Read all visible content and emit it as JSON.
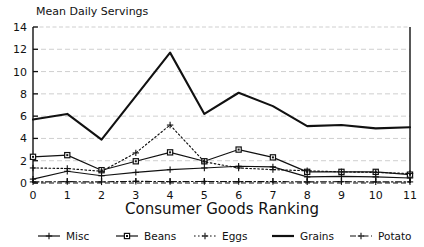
{
  "chart_data": {
    "type": "line",
    "title": "Mean Daily Servings",
    "xlabel": "Consumer Goods Ranking",
    "ylabel": "",
    "x": [
      0,
      1,
      2,
      3,
      4,
      5,
      6,
      7,
      8,
      9,
      10,
      11
    ],
    "xticklabels": [
      "0",
      "1",
      "2",
      "3",
      "4",
      "5",
      "6",
      "7",
      "8",
      "9",
      "10",
      "11"
    ],
    "yticklabels": [
      "0",
      "2",
      "4",
      "6",
      "8",
      "10",
      "12",
      "14"
    ],
    "yticks": [
      0,
      2,
      4,
      6,
      8,
      10,
      12,
      14
    ],
    "xlim": [
      0,
      11
    ],
    "ylim": [
      0,
      14
    ],
    "grid": true,
    "legend_position": "below",
    "series": [
      {
        "name": "Misc",
        "marker": "plus",
        "dash": "solid",
        "values": [
          0.35,
          1.05,
          0.65,
          0.95,
          1.2,
          1.35,
          1.5,
          1.45,
          0.55,
          0.6,
          0.55,
          0.45
        ]
      },
      {
        "name": "Beans",
        "marker": "square",
        "dash": "solid",
        "values": [
          2.35,
          2.5,
          1.15,
          1.95,
          2.75,
          1.95,
          3.0,
          2.3,
          1.0,
          1.0,
          1.0,
          0.75
        ]
      },
      {
        "name": "Eggs",
        "marker": "plus",
        "dash": "dotted",
        "values": [
          1.35,
          1.3,
          1.05,
          2.7,
          5.2,
          1.9,
          1.35,
          1.2,
          1.1,
          1.0,
          0.95,
          0.85
        ]
      },
      {
        "name": "Grains",
        "marker": "none",
        "dash": "solid",
        "values": [
          5.7,
          6.2,
          3.9,
          7.8,
          11.7,
          6.2,
          8.1,
          6.9,
          5.1,
          5.2,
          4.9,
          5.0
        ]
      },
      {
        "name": "Potato",
        "marker": "plus",
        "dash": "dashdot",
        "values": [
          0.1,
          0.12,
          0.1,
          0.15,
          0.12,
          0.14,
          0.12,
          0.13,
          0.1,
          0.12,
          0.1,
          0.1
        ]
      }
    ]
  },
  "legend": {
    "items": [
      {
        "label": "Misc"
      },
      {
        "label": "Beans"
      },
      {
        "label": "Eggs"
      },
      {
        "label": "Grains"
      },
      {
        "label": "Potato"
      }
    ]
  },
  "colors": {
    "ink": "#111111",
    "grid": "#c9c9c9",
    "background": "#ffffff"
  }
}
